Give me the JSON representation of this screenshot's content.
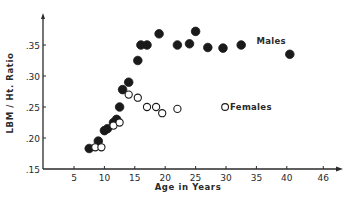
{
  "chart_data": {
    "type": "scatter",
    "title": "",
    "xlabel": "Age in Years",
    "ylabel": "LBM / Ht. Ratio",
    "xlim": [
      0,
      48
    ],
    "ylim": [
      0.15,
      0.39
    ],
    "grid": false,
    "x_ticks": [
      {
        "value": 5,
        "label": "5"
      },
      {
        "value": 10,
        "label": "10"
      },
      {
        "value": 15,
        "label": "15"
      },
      {
        "value": 20,
        "label": "20"
      },
      {
        "value": 25,
        "label": "25"
      },
      {
        "value": 30,
        "label": "30"
      },
      {
        "value": 35,
        "label": "35"
      },
      {
        "value": 40,
        "label": "40"
      },
      {
        "value": 46,
        "label": "46"
      }
    ],
    "y_ticks": [
      {
        "value": 0.15,
        "label": ".15"
      },
      {
        "value": 0.2,
        "label": ".20"
      },
      {
        "value": 0.25,
        "label": ".25"
      },
      {
        "value": 0.3,
        "label": ".30"
      },
      {
        "value": 0.35,
        "label": ".35"
      }
    ],
    "series": [
      {
        "name": "Males",
        "marker": "filled-circle",
        "color": "#1a1a1a",
        "points": [
          [
            7.5,
            0.183
          ],
          [
            9.0,
            0.195
          ],
          [
            10.0,
            0.212
          ],
          [
            10.5,
            0.215
          ],
          [
            11.5,
            0.225
          ],
          [
            12.0,
            0.23
          ],
          [
            12.5,
            0.25
          ],
          [
            13.0,
            0.278
          ],
          [
            14.0,
            0.29
          ],
          [
            15.5,
            0.325
          ],
          [
            16.0,
            0.35
          ],
          [
            17.0,
            0.35
          ],
          [
            19.0,
            0.368
          ],
          [
            22.0,
            0.35
          ],
          [
            24.0,
            0.352
          ],
          [
            25.0,
            0.372
          ],
          [
            27.0,
            0.346
          ],
          [
            29.5,
            0.345
          ],
          [
            32.5,
            0.35
          ],
          [
            40.5,
            0.335
          ]
        ]
      },
      {
        "name": "Females",
        "marker": "open-circle",
        "color": "#1a1a1a",
        "points": [
          [
            8.5,
            0.185
          ],
          [
            9.5,
            0.185
          ],
          [
            11.5,
            0.22
          ],
          [
            12.5,
            0.225
          ],
          [
            14.0,
            0.27
          ],
          [
            15.5,
            0.265
          ],
          [
            17.0,
            0.25
          ],
          [
            18.5,
            0.25
          ],
          [
            19.5,
            0.24
          ],
          [
            22.0,
            0.247
          ]
        ]
      }
    ],
    "annotations": [
      {
        "text": "Males",
        "x": 35,
        "y": 0.356
      },
      {
        "text": "Females",
        "x": 31,
        "y": 0.25
      }
    ],
    "legend": "inline labels"
  }
}
